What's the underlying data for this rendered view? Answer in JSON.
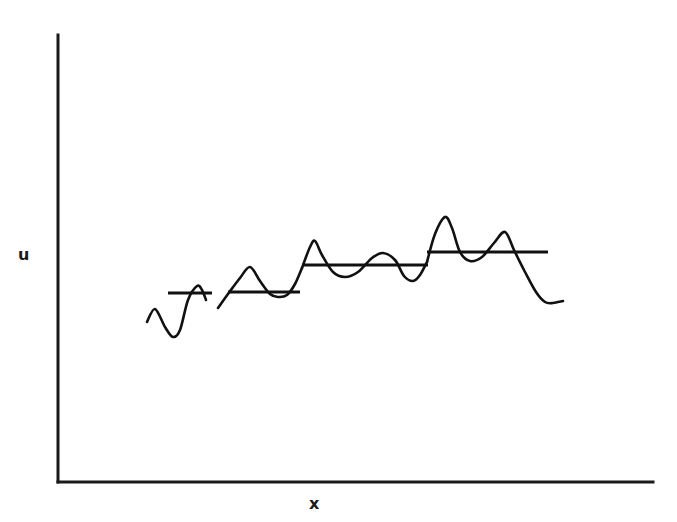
{
  "chart_data": {
    "type": "line",
    "title": "",
    "xlabel": "x",
    "ylabel": "u",
    "grid": false,
    "legend": null,
    "axis_ranges": {
      "x": "unlabeled (no ticks)",
      "y": "unlabeled (no ticks)"
    },
    "series": [
      {
        "name": "u(x) segment 1",
        "pixel_points": [
          [
            147,
            322
          ],
          [
            155,
            309
          ],
          [
            165,
            327
          ],
          [
            173,
            337
          ],
          [
            180,
            330
          ],
          [
            188,
            300
          ],
          [
            197,
            286
          ],
          [
            202,
            290
          ],
          [
            206,
            300
          ]
        ]
      },
      {
        "name": "u(x) segment 2",
        "pixel_points": [
          [
            218,
            308
          ],
          [
            228,
            294
          ],
          [
            240,
            278
          ],
          [
            250,
            267
          ],
          [
            260,
            281
          ],
          [
            270,
            294
          ],
          [
            278,
            297
          ],
          [
            287,
            295
          ],
          [
            295,
            284
          ],
          [
            302,
            268
          ]
        ]
      },
      {
        "name": "u(x) segment 3",
        "pixel_points": [
          [
            302,
            268
          ],
          [
            310,
            247
          ],
          [
            315,
            241
          ],
          [
            322,
            255
          ],
          [
            333,
            272
          ],
          [
            345,
            277
          ],
          [
            358,
            272
          ],
          [
            372,
            258
          ],
          [
            383,
            253
          ],
          [
            395,
            260
          ],
          [
            404,
            276
          ],
          [
            413,
            281
          ],
          [
            420,
            275
          ],
          [
            427,
            262
          ]
        ]
      },
      {
        "name": "u(x) segment 4",
        "pixel_points": [
          [
            427,
            262
          ],
          [
            435,
            234
          ],
          [
            445,
            217
          ],
          [
            452,
            228
          ],
          [
            460,
            252
          ],
          [
            470,
            261
          ],
          [
            482,
            257
          ],
          [
            494,
            243
          ],
          [
            505,
            232
          ],
          [
            514,
            250
          ],
          [
            525,
            272
          ],
          [
            536,
            292
          ],
          [
            545,
            302
          ],
          [
            553,
            303
          ],
          [
            563,
            301
          ]
        ]
      }
    ],
    "local_means": [
      {
        "name": "mean segment 1",
        "x_start": 168,
        "x_end": 212,
        "y_pixel": 293
      },
      {
        "name": "mean segment 2",
        "x_start": 228,
        "x_end": 300,
        "y_pixel": 292
      },
      {
        "name": "mean segment 3",
        "x_start": 302,
        "x_end": 428,
        "y_pixel": 265
      },
      {
        "name": "mean segment 4",
        "x_start": 427,
        "x_end": 548,
        "y_pixel": 252
      }
    ]
  },
  "axes": {
    "x_label": "x",
    "y_label": "u"
  }
}
